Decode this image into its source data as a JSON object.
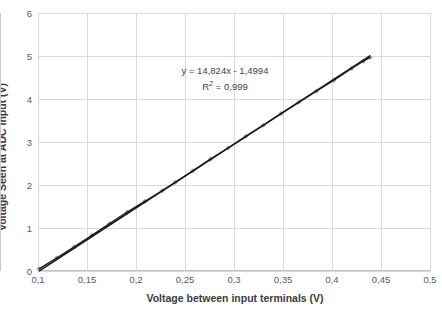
{
  "chart_data": {
    "type": "scatter",
    "title": "",
    "xlabel": "Voltage between input terminals (V)",
    "ylabel": "Voltage Seen at ADC input (V)",
    "xlim": [
      0.1,
      0.5
    ],
    "ylim": [
      0,
      6
    ],
    "xticks": [
      "0,1",
      "0,15",
      "0,2",
      "0,25",
      "0,3",
      "0,35",
      "0,4",
      "0,45",
      "0,5"
    ],
    "xtick_values": [
      0.1,
      0.15,
      0.2,
      0.25,
      0.3,
      0.35,
      0.4,
      0.45,
      0.5
    ],
    "yticks": [
      "0",
      "1",
      "2",
      "3",
      "4",
      "5",
      "6"
    ],
    "ytick_values": [
      0,
      1,
      2,
      3,
      4,
      5,
      6
    ],
    "grid": true,
    "legend": false,
    "series": [
      {
        "name": "measured",
        "marker": "diamond",
        "marker_color": "#a6a6a6",
        "line_color": "#1a1a1a",
        "x": [
          0.101,
          0.119,
          0.137,
          0.155,
          0.173,
          0.191,
          0.209,
          0.227,
          0.24,
          0.258,
          0.276,
          0.294,
          0.312,
          0.33,
          0.348,
          0.366,
          0.384,
          0.402,
          0.42,
          0.432,
          0.439
        ],
        "y": [
          0.05,
          0.3,
          0.56,
          0.83,
          1.1,
          1.37,
          1.62,
          1.87,
          2.06,
          2.33,
          2.6,
          2.86,
          3.13,
          3.39,
          3.66,
          3.92,
          4.18,
          4.44,
          4.71,
          4.88,
          4.97
        ]
      }
    ],
    "trendline": {
      "equation": "y = 14,824x - 1,4994",
      "r_squared_label": "R",
      "r_squared_exponent": "2",
      "r_squared_value": " = 0,999",
      "slope": 14.824,
      "intercept": -1.4994,
      "r2": 0.999,
      "color": "#1a1a1a"
    },
    "colors": {
      "grid": "#d9d9d9",
      "axis": "#bfbfbf",
      "text": "#595959",
      "title_text": "#3b3b3b",
      "background": "#ffffff"
    }
  }
}
